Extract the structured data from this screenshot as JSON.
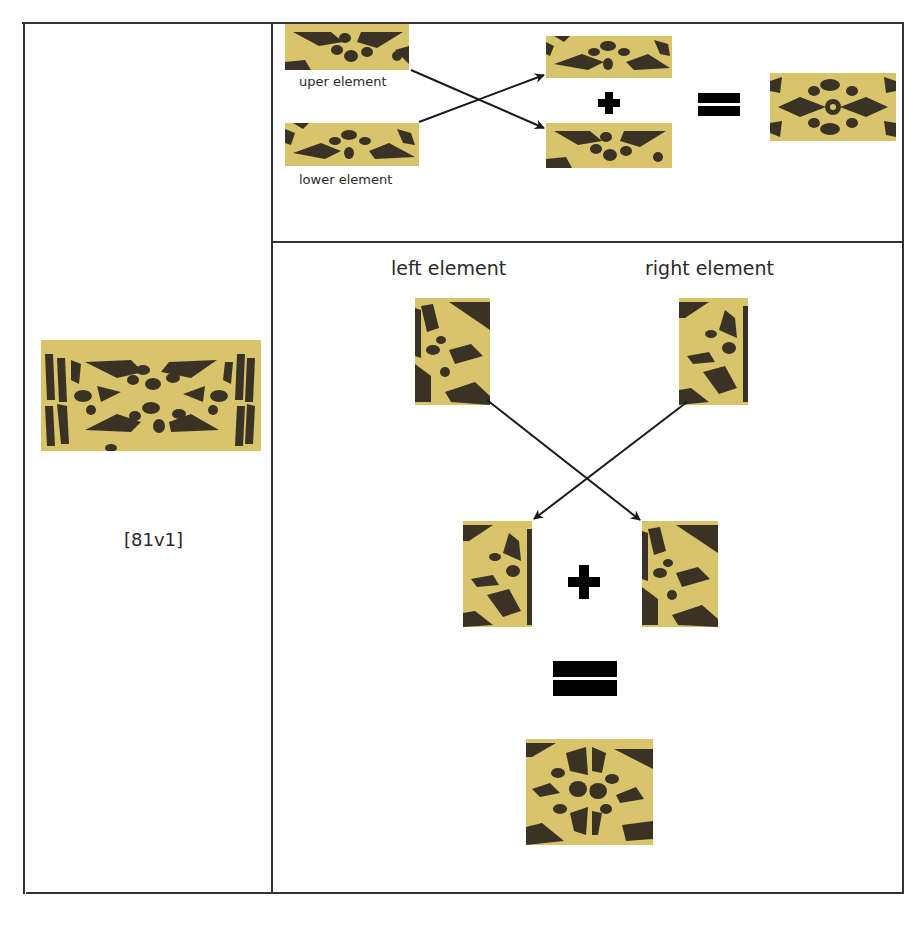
{
  "colors": {
    "pattern_light": "#d8c46a",
    "pattern_dark": "#3b3226",
    "border": "#333333",
    "symbol": "#000000"
  },
  "left_cell": {
    "image_label": "pattern-81v1-full",
    "caption": "[81v1]"
  },
  "top_cell": {
    "upper_label": "uper element",
    "lower_label": "lower element",
    "operator_plus": "+",
    "operator_equals": "="
  },
  "bottom_cell": {
    "left_label": "left element",
    "right_label": "right element",
    "operator_plus": "+",
    "operator_equals": "="
  }
}
